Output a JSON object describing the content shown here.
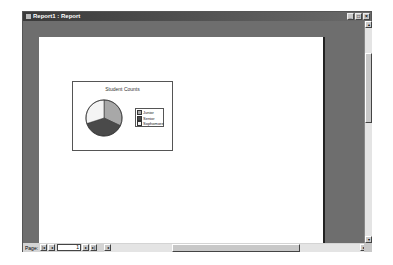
{
  "window": {
    "title": "Report1 : Report",
    "buttons": {
      "minimize": "_",
      "maximize": "□",
      "close": "×"
    }
  },
  "report": {
    "chart": {
      "title": "Student Counts",
      "legend": [
        "Junior",
        "Senior",
        "Sophomore"
      ]
    }
  },
  "chart_data": {
    "type": "pie",
    "title": "Student Counts",
    "categories": [
      "Junior",
      "Senior",
      "Sophomore"
    ],
    "values": [
      32,
      38,
      30
    ],
    "colors": [
      "#a8a8a8",
      "#4a4a4a",
      "#f4f4f4"
    ],
    "legend_position": "right"
  },
  "navigation": {
    "page_label": "Page:",
    "current_page": "1",
    "first_icon": "|◂",
    "prev_icon": "◂",
    "next_icon": "▸",
    "last_icon": "▸|"
  },
  "scroll": {
    "up": "▴",
    "down": "▾",
    "left": "◂",
    "right": "▸"
  }
}
